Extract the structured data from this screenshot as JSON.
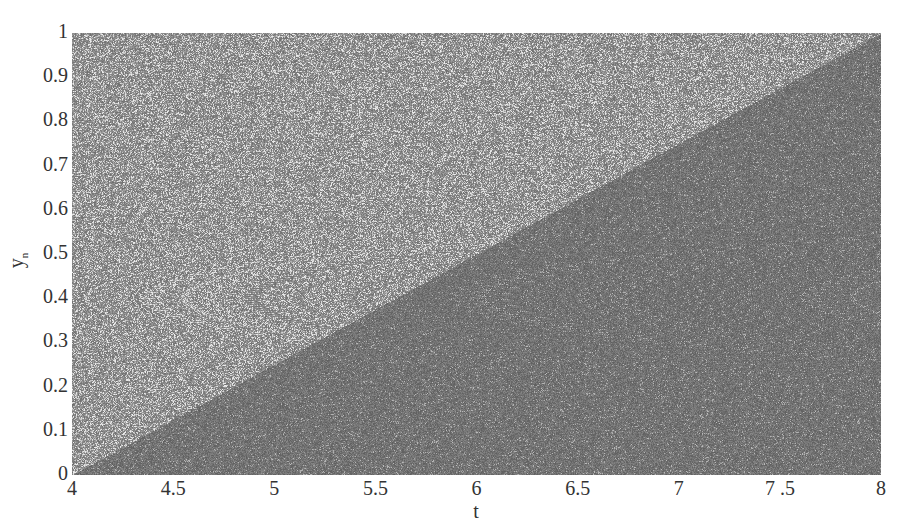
{
  "chart_data": {
    "type": "scatter",
    "title": "",
    "xlabel": "t",
    "ylabel": "y_n",
    "xlim": [
      4,
      8
    ],
    "ylim": [
      0,
      1
    ],
    "xticks": [
      "4",
      "4.5",
      "5",
      "5.5",
      "6",
      "6.5",
      "7",
      "7 .5",
      "8"
    ],
    "yticks": [
      "0",
      "0.1",
      "0.2",
      "0.3",
      "0.4",
      "0.5",
      "0.6",
      "0.7",
      "0.8",
      "0.9",
      "1"
    ],
    "grid": false,
    "legend": null,
    "boundary_line": {
      "x": [
        4,
        8
      ],
      "y": [
        0,
        1
      ]
    },
    "colors": {
      "upper_region": "#8a8a8a",
      "lower_region": "#6e6e6e",
      "speckle_light": "#d8d8d8"
    }
  }
}
